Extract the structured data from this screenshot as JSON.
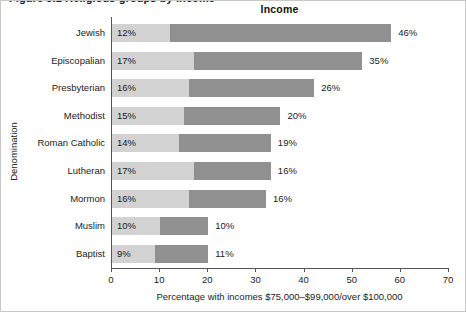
{
  "figure": {
    "clipped_heading": "Figure 3.1  Religious groups by income",
    "border_color": "#c8c8c8"
  },
  "chart_data": {
    "type": "bar",
    "orientation": "horizontal",
    "stacked": true,
    "title": "Income",
    "xlabel": "Percentage with incomes $75,000–$99,000/over $100,000",
    "ylabel": "Denomination",
    "xlim": [
      0,
      70
    ],
    "xticks": [
      0,
      10,
      20,
      30,
      40,
      50,
      60,
      70
    ],
    "xtick_labels": [
      "0",
      "10",
      "20",
      "30",
      "40",
      "50",
      "60",
      "70"
    ],
    "grid": false,
    "legend": false,
    "categories": [
      "Jewish",
      "Episcopalian",
      "Presbyterian",
      "Methodist",
      "Roman Catholic",
      "Lutheran",
      "Mormon",
      "Muslim",
      "Baptist"
    ],
    "series": [
      {
        "name": "$75,000–$99,000",
        "color": "#d2d2d2",
        "values": [
          12,
          17,
          16,
          15,
          14,
          17,
          16,
          10,
          9
        ],
        "labels": [
          "12%",
          "17%",
          "16%",
          "15%",
          "14%",
          "17%",
          "16%",
          "10%",
          "9%"
        ]
      },
      {
        "name": "over $100,000",
        "color": "#909090",
        "values": [
          46,
          35,
          26,
          20,
          19,
          16,
          16,
          10,
          11
        ],
        "labels": [
          "46%",
          "35%",
          "26%",
          "20%",
          "19%",
          "16%",
          "16%",
          "10%",
          "11%"
        ]
      }
    ]
  }
}
